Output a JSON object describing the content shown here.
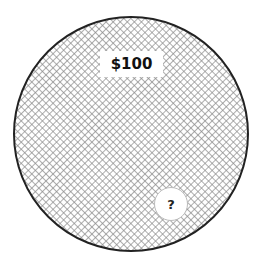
{
  "diagram": {
    "shape": "circle",
    "fill_pattern": "crosshatch",
    "stroke_color": "#222222",
    "value_label": "$100",
    "unknown_marker": "?"
  }
}
